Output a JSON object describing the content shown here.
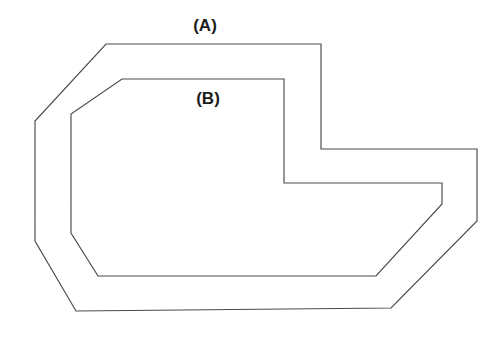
{
  "figure": {
    "type": "line-drawing",
    "background_color": "#ffffff",
    "stroke_color": "#4a4a4a",
    "stroke_width_px": 1.15,
    "canvas": {
      "width": 502,
      "height": 345
    }
  },
  "labels": [
    {
      "id": "label-a",
      "text": "(A)",
      "x": 205,
      "y": 26,
      "refers_to": "outer-polygon",
      "color": "#1c1c1c",
      "font_size_px": 17,
      "font_weight": "bold"
    },
    {
      "id": "label-b",
      "text": "(B)",
      "x": 208,
      "y": 99,
      "refers_to": "inner-polygon",
      "color": "#1c1c1c",
      "font_size_px": 17,
      "font_weight": "bold"
    }
  ],
  "shapes": [
    {
      "id": "outer-polygon",
      "name": "outer-outline",
      "label": "(A)",
      "closed": true,
      "points": "106,44 321,44 321,149 477,149 477,221 391,308 76,311 35,241 35,121"
    },
    {
      "id": "inner-polygon",
      "name": "inner-outline",
      "label": "(B)",
      "closed": true,
      "points": "122,79 284,79 284,183 442,183 442,204 376,276 98,276 71,233 71,114"
    }
  ]
}
